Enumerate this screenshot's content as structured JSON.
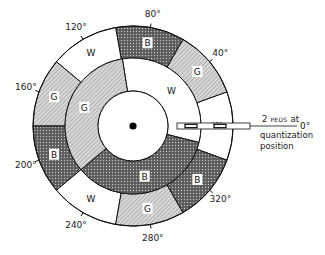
{
  "diagram": {
    "type": "color-wheel-encoder",
    "outer_ring": [
      {
        "label": "W",
        "color": "white",
        "start_deg": -20,
        "end_deg": 20
      },
      {
        "label": "G",
        "color": "gray",
        "start_deg": 20,
        "end_deg": 60
      },
      {
        "label": "B",
        "color": "black",
        "start_deg": 60,
        "end_deg": 100
      },
      {
        "label": "W",
        "color": "white",
        "start_deg": 100,
        "end_deg": 140
      },
      {
        "label": "G",
        "color": "gray",
        "start_deg": 140,
        "end_deg": 180
      },
      {
        "label": "B",
        "color": "black",
        "start_deg": 180,
        "end_deg": 220
      },
      {
        "label": "W",
        "color": "white",
        "start_deg": 220,
        "end_deg": 260
      },
      {
        "label": "G",
        "color": "gray",
        "start_deg": 260,
        "end_deg": 300
      },
      {
        "label": "B",
        "color": "black",
        "start_deg": 300,
        "end_deg": 340
      }
    ],
    "inner_ring": [
      {
        "label": "W",
        "color": "white",
        "start_deg": -14,
        "end_deg": 99
      },
      {
        "label": "G",
        "color": "gray",
        "start_deg": 99,
        "end_deg": 220
      },
      {
        "label": "B",
        "color": "black",
        "start_deg": 220,
        "end_deg": 346
      }
    ],
    "angle_labels": [
      {
        "text": "0°",
        "deg": 0
      },
      {
        "text": "40°",
        "deg": 40
      },
      {
        "text": "80°",
        "deg": 80
      },
      {
        "text": "120°",
        "deg": 120
      },
      {
        "text": "160°",
        "deg": 160
      },
      {
        "text": "200°",
        "deg": 200
      },
      {
        "text": "240°",
        "deg": 240
      },
      {
        "text": "280°",
        "deg": 280
      },
      {
        "text": "320°",
        "deg": 320
      }
    ],
    "annotation": {
      "line1_prefix": "2",
      "line1_smallcaps": "PEDS",
      "line1_suffix": "at",
      "line2": "quantization",
      "line3": "position"
    }
  }
}
